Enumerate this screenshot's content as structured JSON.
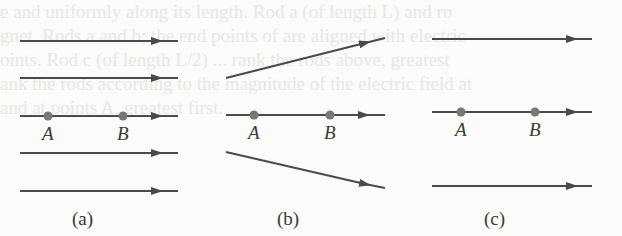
{
  "background_text": [
    "e and uniformly along its length. Rod a (of length L) and ro",
    "gnet. Rods a and b; the end points of are aligned with electric",
    "oints. Rod c (of length L/2) ... rank the rods above, greatest",
    "ank the rods according to the magnitude of the electric field at",
    "and at points A, greatest first."
  ],
  "panels": [
    {
      "id": "a",
      "caption": "(a)",
      "point_labels": [
        "A",
        "B"
      ]
    },
    {
      "id": "b",
      "caption": "(b)",
      "point_labels": [
        "A",
        "B"
      ]
    },
    {
      "id": "c",
      "caption": "(c)",
      "point_labels": [
        "A",
        "B"
      ]
    }
  ],
  "colors": {
    "line": "#4a4a4a",
    "point": "#777777"
  }
}
